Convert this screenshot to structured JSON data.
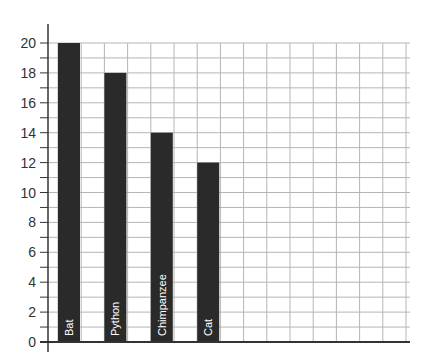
{
  "chart_data": {
    "type": "bar",
    "title": "",
    "xlabel": "",
    "ylabel": "",
    "categories": [
      "Bat",
      "Python",
      "Chimpanzee",
      "Cat"
    ],
    "values": [
      20,
      18,
      14,
      12
    ],
    "ylim": [
      0,
      20
    ],
    "yticks": [
      0,
      2,
      4,
      6,
      8,
      10,
      12,
      14,
      16,
      18,
      20
    ],
    "minor_tick_step": 1,
    "grid": true,
    "legend": null,
    "bar_color": "#2a2a2a",
    "bar_label_color": "#ffffff",
    "bar_label_orientation": "vertical-inside-bottom",
    "grid_color": "#b5b5b5",
    "axis_color": "#333333"
  }
}
